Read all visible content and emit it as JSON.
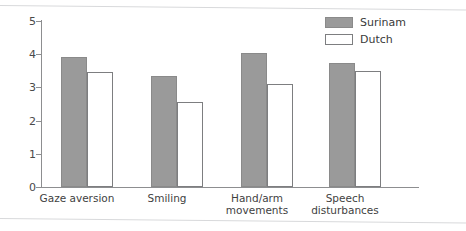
{
  "chart_data": {
    "type": "bar",
    "title": "",
    "subtitle": "",
    "xlabel": "",
    "ylabel": "",
    "ylim": [
      0,
      5
    ],
    "ytick_labels": [
      "0",
      "1",
      "2",
      "3",
      "4",
      "5"
    ],
    "ytick_values": [
      0,
      1,
      2,
      3,
      4,
      5
    ],
    "grid": false,
    "legend_position": "top-right",
    "categories": [
      "Gaze aversion",
      "Smiling",
      "Hand/arm\nmovements",
      "Speech\ndisturbances"
    ],
    "series": [
      {
        "name": "Surinam",
        "color": "#9a9a9a",
        "values": [
          3.92,
          3.35,
          4.05,
          3.73
        ]
      },
      {
        "name": "Dutch",
        "color": "#ffffff",
        "values": [
          3.47,
          2.55,
          3.1,
          3.48
        ]
      }
    ]
  },
  "legend": {
    "entries": [
      {
        "label": "Surinam",
        "swatch": "filled-gray-swatch"
      },
      {
        "label": "Dutch",
        "swatch": "outlined-white-swatch"
      }
    ]
  },
  "colors": {
    "bar_fill_surinam": "#9a9a9a",
    "bar_fill_dutch": "#ffffff",
    "bar_stroke": "#8a8a8a",
    "axis": "#8d8e90",
    "text": "#3a3a3a",
    "page_rule": "#d8d9db",
    "background": "#ffffff"
  }
}
